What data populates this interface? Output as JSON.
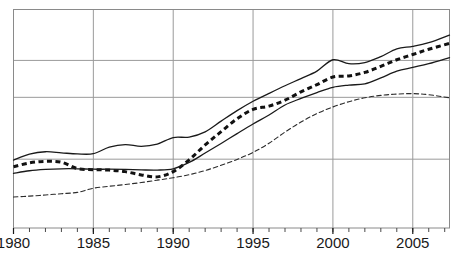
{
  "chart_data": {
    "type": "line",
    "title": "",
    "subtitle": "",
    "xlabel": "",
    "ylabel": "",
    "xlim": [
      1980,
      2007.3
    ],
    "ylim": [
      0,
      100
    ],
    "grid": true,
    "grid_axis": "both",
    "legend": "none",
    "x_tick_labels": [
      "1980",
      "1985",
      "1990",
      "1995",
      "2000",
      "2005"
    ],
    "x_ticks": [
      1980,
      1985,
      1990,
      1995,
      2000,
      2005
    ],
    "x_minor_tick_interval": 1,
    "y_tick_labels": [],
    "y_gridline_values": [
      31.5,
      59.8,
      76.7
    ],
    "y_axis_visible_labels": false,
    "series": [
      {
        "name": "series-1-upper-solid",
        "style": "solid",
        "color": "#1a1a1a",
        "width": 1.3,
        "x": [
          1980,
          1981,
          1982,
          1983,
          1984,
          1985,
          1986,
          1987,
          1988,
          1989,
          1990,
          1991,
          1992,
          1993,
          1994,
          1995,
          1996,
          1997,
          1998,
          1999,
          2000,
          2001,
          2002,
          2003,
          2004,
          2005,
          2006,
          2007.3
        ],
        "values": [
          31.1,
          33.8,
          34.9,
          34.4,
          33.9,
          34.0,
          37.0,
          38.2,
          37.4,
          38.4,
          41.4,
          41.6,
          44.0,
          48.9,
          53.7,
          58.0,
          61.6,
          65.1,
          68.4,
          71.8,
          77.0,
          75.2,
          75.7,
          78.4,
          82.0,
          83.1,
          84.8,
          88.3
        ]
      },
      {
        "name": "series-2-bold-dashed",
        "style": "dashed-bold",
        "color": "#111111",
        "width": 3.0,
        "dash": "5,3.5",
        "x": [
          1980,
          1981,
          1982,
          1983,
          1984,
          1985,
          1986,
          1987,
          1988,
          1989,
          1990,
          1991,
          1992,
          1993,
          1994,
          1995,
          1996,
          1997,
          1998,
          1999,
          2000,
          2001,
          2002,
          2003,
          2004,
          2005,
          2006,
          2007.3
        ],
        "values": [
          28.0,
          29.8,
          30.5,
          30.1,
          27.2,
          26.7,
          26.5,
          25.8,
          24.3,
          23.4,
          25.8,
          31.2,
          38.0,
          44.1,
          50.0,
          54.3,
          55.8,
          58.5,
          62.3,
          65.6,
          69.1,
          69.6,
          71.2,
          74.0,
          77.0,
          79.4,
          81.8,
          84.5
        ]
      },
      {
        "name": "series-3-lower-solid",
        "style": "solid",
        "color": "#1a1a1a",
        "width": 1.3,
        "x": [
          1980,
          1981,
          1982,
          1983,
          1984,
          1985,
          1986,
          1987,
          1988,
          1989,
          1990,
          1991,
          1992,
          1993,
          1994,
          1995,
          1996,
          1997,
          1998,
          1999,
          2000,
          2001,
          2002,
          2003,
          2004,
          2005,
          2006,
          2007.3
        ],
        "values": [
          25.0,
          26.2,
          26.8,
          27.1,
          27.1,
          26.9,
          26.9,
          26.8,
          26.6,
          26.5,
          27.1,
          30.0,
          34.3,
          38.7,
          43.2,
          47.6,
          51.7,
          56.3,
          59.3,
          62.0,
          64.4,
          65.4,
          66.0,
          68.7,
          71.8,
          73.5,
          75.2,
          78.0
        ]
      },
      {
        "name": "series-4-thin-dashed",
        "style": "dashed-thin",
        "color": "#2b2b2b",
        "width": 1.1,
        "dash": "4.5,3",
        "x": [
          1980,
          1981,
          1982,
          1983,
          1984,
          1985,
          1986,
          1987,
          1988,
          1989,
          1990,
          1991,
          1992,
          1993,
          1994,
          1995,
          1996,
          1997,
          1998,
          1999,
          2000,
          2001,
          2002,
          2003,
          2004,
          2005,
          2006,
          2007.3
        ],
        "values": [
          14.2,
          14.6,
          15.1,
          15.7,
          16.3,
          18.2,
          19.1,
          19.9,
          20.8,
          21.9,
          23.0,
          24.4,
          26.3,
          28.7,
          31.4,
          34.6,
          38.8,
          43.9,
          48.5,
          52.4,
          55.4,
          57.8,
          59.6,
          60.7,
          61.3,
          61.5,
          61.0,
          59.6
        ]
      }
    ]
  },
  "caption": {
    "text": ""
  }
}
